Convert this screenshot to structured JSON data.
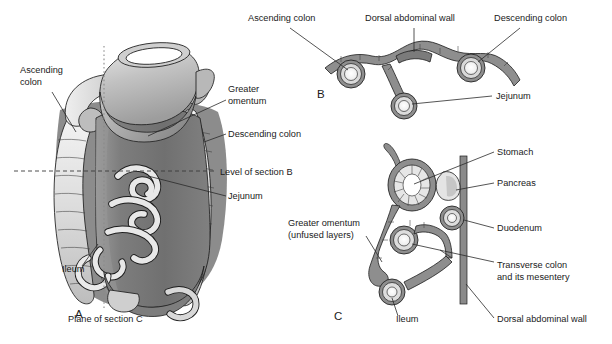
{
  "figure": {
    "background_color": "#ffffff",
    "text_color": "#1a1a1a",
    "line_color": "#2a2a2a"
  },
  "palette": {
    "dark_gray": "#6e6e6e",
    "mid_gray": "#8e8e8e",
    "light_gray": "#c9c9c9",
    "pale_gray": "#e2e2e2",
    "very_pale": "#f2f2f2",
    "white": "#ffffff",
    "omentum_gray": "#7a7a7a",
    "wall_gray": "#9a9a9a"
  },
  "panels": [
    {
      "id": "A",
      "letter": "A",
      "x": 75,
      "y": 318
    },
    {
      "id": "B",
      "letter": "B",
      "x": 317,
      "y": 98
    },
    {
      "id": "C",
      "letter": "C",
      "x": 334,
      "y": 320
    }
  ],
  "panel_a": {
    "labels": [
      {
        "name": "ascending-colon",
        "lines": [
          "Ascending",
          "colon"
        ],
        "x": 20,
        "y": 73,
        "anchor": "start"
      },
      {
        "name": "greater-omentum",
        "lines": [
          "Greater",
          "omentum"
        ],
        "x": 228,
        "y": 92,
        "anchor": "start"
      },
      {
        "name": "descending-colon",
        "lines": [
          "Descending colon"
        ],
        "x": 228,
        "y": 137,
        "anchor": "start"
      },
      {
        "name": "level-of-section-b",
        "lines": [
          "Level of section B"
        ],
        "x": 220,
        "y": 175,
        "anchor": "start"
      },
      {
        "name": "jejunum",
        "lines": [
          "Jejunum"
        ],
        "x": 228,
        "y": 199,
        "anchor": "start"
      },
      {
        "name": "ileum",
        "lines": [
          "Ileum"
        ],
        "x": 62,
        "y": 272,
        "anchor": "start"
      },
      {
        "name": "plane-of-section-c",
        "lines": [
          "Plane of section C"
        ],
        "x": 68,
        "y": 322,
        "anchor": "start"
      }
    ],
    "guides": {
      "level_of_section_b": "horizontal dashed line",
      "plane_of_section_c": "vertical dotted line"
    }
  },
  "panel_b": {
    "labels": [
      {
        "name": "ascending-colon",
        "lines": [
          "Ascending colon"
        ],
        "x": 248,
        "y": 21,
        "anchor": "start"
      },
      {
        "name": "dorsal-abdominal-wall",
        "lines": [
          "Dorsal abdominal wall"
        ],
        "x": 365,
        "y": 21,
        "anchor": "start"
      },
      {
        "name": "descending-colon",
        "lines": [
          "Descending colon"
        ],
        "x": 494,
        "y": 21,
        "anchor": "start"
      },
      {
        "name": "jejunum",
        "lines": [
          "Jejunum"
        ],
        "x": 496,
        "y": 99,
        "anchor": "start"
      }
    ]
  },
  "panel_c": {
    "labels": [
      {
        "name": "stomach",
        "lines": [
          "Stomach"
        ],
        "x": 497,
        "y": 155,
        "anchor": "start"
      },
      {
        "name": "pancreas",
        "lines": [
          "Pancreas"
        ],
        "x": 497,
        "y": 186,
        "anchor": "start"
      },
      {
        "name": "greater-omentum-unfused",
        "lines": [
          "Greater omentum",
          "(unfused layers)"
        ],
        "x": 288,
        "y": 226,
        "anchor": "start"
      },
      {
        "name": "duodenum",
        "lines": [
          "Duodenum"
        ],
        "x": 497,
        "y": 231,
        "anchor": "start"
      },
      {
        "name": "transverse-colon",
        "lines": [
          "Transverse colon",
          "and its mesentery"
        ],
        "x": 497,
        "y": 268,
        "anchor": "start"
      },
      {
        "name": "ileum",
        "lines": [
          "Ileum"
        ],
        "x": 396,
        "y": 322,
        "anchor": "start"
      },
      {
        "name": "dorsal-abdominal-wall",
        "lines": [
          "Dorsal abdominal wall"
        ],
        "x": 497,
        "y": 322,
        "anchor": "start"
      }
    ]
  }
}
